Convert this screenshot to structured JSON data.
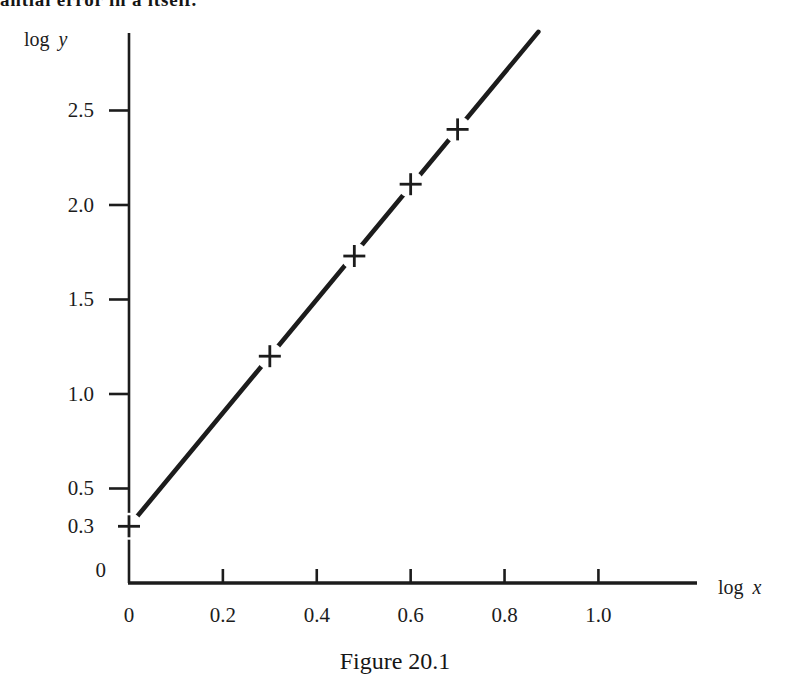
{
  "page": {
    "top_text_clipped": "antial error in a itself.",
    "caption": "Figure 20.1"
  },
  "colors": {
    "ink": "#1c1c1c",
    "paper": "#ffffff"
  },
  "chart_data": {
    "type": "scatter",
    "title": "Figure 20.1",
    "xlabel": "log x",
    "ylabel": "log y",
    "xlabel_word": "log",
    "xlabel_var": "x",
    "ylabel_word": "log",
    "ylabel_var": "y",
    "marker_glyph": "+",
    "points": [
      {
        "x": 0,
        "y": 0.3
      },
      {
        "x": 0.3,
        "y": 1.2
      },
      {
        "x": 0.48,
        "y": 1.73
      },
      {
        "x": 0.6,
        "y": 2.11
      },
      {
        "x": 0.7,
        "y": 2.4
      }
    ],
    "line": {
      "x1": 0,
      "y1": 0.3,
      "x2": 0.872,
      "y2": 2.916
    },
    "xticks": [
      {
        "label": "0",
        "value": 0,
        "tick": false
      },
      {
        "label": "0.2",
        "value": 0.2,
        "tick": true
      },
      {
        "label": "0.4",
        "value": 0.4,
        "tick": true
      },
      {
        "label": "0.6",
        "value": 0.6,
        "tick": true
      },
      {
        "label": "0.8",
        "value": 0.8,
        "tick": true
      },
      {
        "label": "1.0",
        "value": 1.0,
        "tick": true
      }
    ],
    "yticks": [
      {
        "label": "2.5",
        "value": 2.5,
        "tick": true
      },
      {
        "label": "2.0",
        "value": 2.0,
        "tick": true
      },
      {
        "label": "1.5",
        "value": 1.5,
        "tick": true
      },
      {
        "label": "1.0",
        "value": 1.0,
        "tick": true
      },
      {
        "label": "0.5",
        "value": 0.5,
        "tick": true
      },
      {
        "label": "0.3",
        "value": 0.3,
        "tick": false
      },
      {
        "label": "0",
        "value": 0,
        "tick": false
      }
    ],
    "xlim": [
      0,
      1.21
    ],
    "ylim": [
      0,
      2.91
    ],
    "grid": false,
    "legend": false
  }
}
